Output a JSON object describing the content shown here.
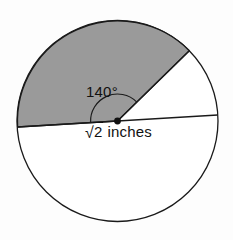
{
  "figure": {
    "type": "circle-sector-diagram",
    "background_color": "#fdfdfd",
    "circle": {
      "center_x": 117.5,
      "center_y": 121,
      "radius": 100.5,
      "stroke_color": "#1a1a1a",
      "fill_color": "#ffffff",
      "stroke_width": 1.3
    },
    "shaded_sector": {
      "fill_color": "#9a9a9a",
      "start_angle_deg": 44.4,
      "end_angle_deg": 184.4,
      "sweep_deg": 140
    },
    "center_point": {
      "color": "#111111",
      "radius": 3.4
    },
    "diameter_line": {
      "from_x": 17.6,
      "from_y": 127,
      "to_x": 217.6,
      "to_y": 115,
      "tilt_deg": -3.4
    },
    "sector_radius_line": {
      "to_x": 189.3,
      "to_y": 50.7
    },
    "angle_arc": {
      "radius": 27,
      "stroke_color": "#1a1a1a"
    }
  },
  "labels": {
    "angle": "140°",
    "angle_value": 140,
    "angle_unit": "degrees",
    "radius_prefix": "√",
    "radius_radicand": "2",
    "radius_unit": "inches",
    "radius_full": "√2 inches"
  }
}
